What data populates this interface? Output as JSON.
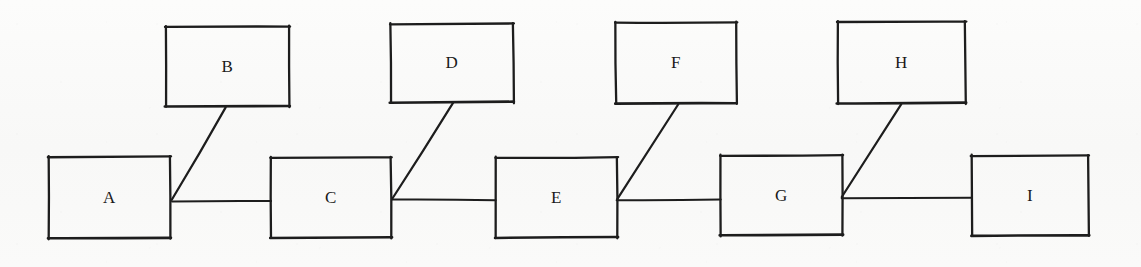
{
  "canvas": {
    "width": 1141,
    "height": 267,
    "background_color": "#fbfbfa",
    "ink_color": "#1d1d1d",
    "style": "hand-drawn-scan"
  },
  "diagram": {
    "type": "node-link-chain",
    "title": "",
    "node_shape": "rectangle",
    "nodes": [
      {
        "id": "A",
        "label": "A",
        "x": 49,
        "y": 157,
        "w": 121,
        "h": 81,
        "row": "bottom"
      },
      {
        "id": "B",
        "label": "B",
        "x": 166,
        "y": 27,
        "w": 123,
        "h": 79,
        "row": "top"
      },
      {
        "id": "C",
        "label": "C",
        "x": 271,
        "y": 158,
        "w": 120,
        "h": 79,
        "row": "bottom"
      },
      {
        "id": "D",
        "label": "D",
        "x": 391,
        "y": 24,
        "w": 122,
        "h": 78,
        "row": "top"
      },
      {
        "id": "E",
        "label": "E",
        "x": 496,
        "y": 158,
        "w": 121,
        "h": 79,
        "row": "bottom"
      },
      {
        "id": "F",
        "label": "F",
        "x": 616,
        "y": 23,
        "w": 120,
        "h": 80,
        "row": "top"
      },
      {
        "id": "G",
        "label": "G",
        "x": 721,
        "y": 156,
        "w": 121,
        "h": 79,
        "row": "bottom"
      },
      {
        "id": "H",
        "label": "H",
        "x": 838,
        "y": 22,
        "w": 127,
        "h": 81,
        "row": "top"
      },
      {
        "id": "I",
        "label": "I",
        "x": 972,
        "y": 156,
        "w": 116,
        "h": 79,
        "row": "bottom"
      }
    ],
    "edges": [
      {
        "id": "A-C",
        "from": "A",
        "to": "C",
        "kind": "horizontal",
        "x1": 172,
        "y1": 201,
        "x2": 271,
        "y2": 201
      },
      {
        "id": "B-A",
        "from": "B",
        "to": "A",
        "kind": "diagonal",
        "x1": 226,
        "y1": 107,
        "x2": 172,
        "y2": 200
      },
      {
        "id": "C-E",
        "from": "C",
        "to": "E",
        "kind": "horizontal",
        "x1": 392,
        "y1": 200,
        "x2": 496,
        "y2": 200
      },
      {
        "id": "D-C",
        "from": "D",
        "to": "C",
        "kind": "diagonal",
        "x1": 453,
        "y1": 103,
        "x2": 392,
        "y2": 199
      },
      {
        "id": "E-G",
        "from": "E",
        "to": "G",
        "kind": "horizontal",
        "x1": 617,
        "y1": 200,
        "x2": 721,
        "y2": 200
      },
      {
        "id": "F-E",
        "from": "F",
        "to": "E",
        "kind": "diagonal",
        "x1": 678,
        "y1": 104,
        "x2": 617,
        "y2": 199
      },
      {
        "id": "G-I",
        "from": "G",
        "to": "I",
        "kind": "horizontal",
        "x1": 842,
        "y1": 198,
        "x2": 972,
        "y2": 198
      },
      {
        "id": "H-G",
        "from": "H",
        "to": "G",
        "kind": "diagonal",
        "x1": 901,
        "y1": 104,
        "x2": 842,
        "y2": 197
      }
    ]
  }
}
